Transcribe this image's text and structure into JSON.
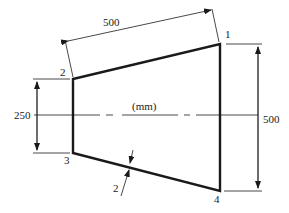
{
  "diagram": {
    "type": "trapezoidal plate with dimensions",
    "units_label": "(mm)",
    "nodes": [
      {
        "id": "1",
        "label": "1"
      },
      {
        "id": "2",
        "label": "2"
      },
      {
        "id": "3",
        "label": "3"
      },
      {
        "id": "4",
        "label": "4"
      }
    ],
    "dimensions": {
      "length": "500",
      "left_height": "250",
      "right_height": "500",
      "thickness": "2"
    },
    "colors": {
      "line": "#1a1a1a",
      "background": "#ffffff"
    }
  }
}
